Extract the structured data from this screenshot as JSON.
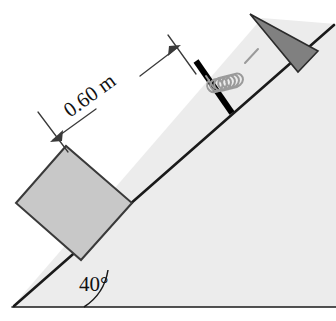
{
  "figure": {
    "kind": "physics-diagram",
    "background_color": "#ffffff"
  },
  "incline": {
    "angle_label": "40°",
    "angle_value": 40,
    "surface_color": "#ececec",
    "edge_color": "#1a1a1a",
    "edge_width": 2.6,
    "base_line_color": "#1a1a1a"
  },
  "block": {
    "label": "",
    "fill_color": "#c8c8c8",
    "stroke_color": "#3a3a3a"
  },
  "plate": {
    "label": "",
    "color": "#000000"
  },
  "spring": {
    "label": "",
    "color": "#9a9a9a",
    "coils": 6
  },
  "wall": {
    "label": "",
    "fill_color": "#808080",
    "stroke_color": "#2b2b2b"
  },
  "dimension": {
    "label": "0.60 m",
    "value": 0.6,
    "units": "m",
    "line_color": "#3a3a3a",
    "text_color": "#111111",
    "rotation_deg": -36
  }
}
